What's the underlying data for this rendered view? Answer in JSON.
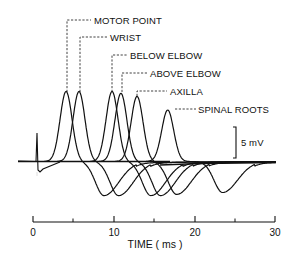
{
  "chart_data": {
    "type": "line",
    "title": "",
    "xlabel": "TIME ( ms )",
    "ylabel": "",
    "xlim": [
      0,
      30
    ],
    "x_ticks": [
      0,
      10,
      20,
      30
    ],
    "x_minor_ticks": [
      5,
      15,
      25
    ],
    "grid": false,
    "scale_bar": {
      "label": "5 mV",
      "value_mV": 5
    },
    "baseline_mV": 0,
    "stimulus_artifact_ms": 0.3,
    "series": [
      {
        "name": "MOTOR POINT",
        "peak_ms": 4.1,
        "peak_mV": 11.3,
        "trough_ms": 8.8,
        "trough_mV": -5.5
      },
      {
        "name": "WRIST",
        "peak_ms": 5.7,
        "peak_mV": 11.3,
        "trough_ms": 10.6,
        "trough_mV": -5.5
      },
      {
        "name": "BELOW ELBOW",
        "peak_ms": 9.8,
        "peak_mV": 11.3,
        "trough_ms": 14.6,
        "trough_mV": -5.5
      },
      {
        "name": "ABOVE ELBOW",
        "peak_ms": 10.9,
        "peak_mV": 11.0,
        "trough_ms": 15.8,
        "trough_mV": -5.5
      },
      {
        "name": "AXILLA",
        "peak_ms": 12.9,
        "peak_mV": 10.5,
        "trough_ms": 17.8,
        "trough_mV": -5.3
      },
      {
        "name": "SPINAL ROOTS",
        "peak_ms": 16.7,
        "peak_mV": 8.3,
        "trough_ms": 23.5,
        "trough_mV": -5.0
      }
    ],
    "legend_position": "annotations above peaks"
  },
  "labels": {
    "motor_point": "MOTOR POINT",
    "wrist": "WRIST",
    "below_elbow": "BELOW ELBOW",
    "above_elbow": "ABOVE ELBOW",
    "axilla": "AXILLA",
    "spinal_roots": "SPINAL ROOTS"
  },
  "axis": {
    "tick_0": "0",
    "tick_10": "10",
    "tick_20": "20",
    "tick_30": "30",
    "title": "TIME ( ms )"
  },
  "scale_bar_label": "5 mV"
}
